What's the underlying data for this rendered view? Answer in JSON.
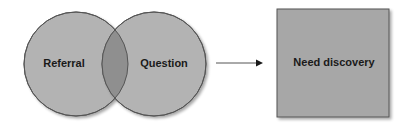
{
  "diagram": {
    "circles": [
      {
        "id": "referral",
        "label": "Referral",
        "cx": 76,
        "cy": 64,
        "r": 52
      },
      {
        "id": "question",
        "label": "Question",
        "cx": 154,
        "cy": 64,
        "r": 52
      }
    ],
    "box": {
      "label": "Need discovery",
      "x": 277,
      "y": 9,
      "w": 112,
      "h": 108
    },
    "arrow": {
      "x1": 216,
      "y1": 63,
      "x2": 262,
      "y2": 63
    },
    "colors": {
      "circle_fill": "#b3b3b3",
      "overlap_fill": "#8f8f8f",
      "box_fill": "#a7a7a7",
      "stroke": "#555555",
      "text": "#1a1a1a"
    }
  }
}
